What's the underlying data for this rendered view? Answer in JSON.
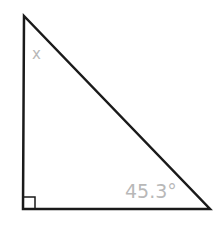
{
  "diagram": {
    "type": "right-triangle",
    "labels": {
      "top_angle": "x",
      "bottom_right_angle": "45.3°"
    },
    "right_angle_at": "bottom-left",
    "colors": {
      "stroke": "#1a1a1a",
      "label": "#b8b8b8"
    }
  }
}
